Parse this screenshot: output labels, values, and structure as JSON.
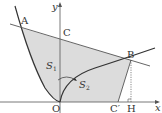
{
  "diagram": {
    "axes": {
      "x_label": "x",
      "y_label": "y",
      "origin_label": "O"
    },
    "points": {
      "A": {
        "label": "A"
      },
      "B": {
        "label": "B"
      },
      "C": {
        "label": "C"
      },
      "C_prime": {
        "label": "C′"
      },
      "H": {
        "label": "H"
      }
    },
    "regions": {
      "S1": {
        "label": "S",
        "sub": "1"
      },
      "S2": {
        "label": "S",
        "sub": "2"
      }
    },
    "colors": {
      "shade": "#dcdcdc",
      "line": "#333333",
      "axis": "#555555"
    }
  }
}
